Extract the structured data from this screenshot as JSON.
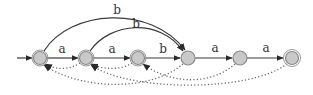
{
  "diagram": {
    "type": "finite-automaton",
    "colors": {
      "node_fill": "#c9c9c9",
      "node_stroke": "#8a8a8a",
      "edge": "#3a3a3a",
      "failure_link": "#6a6a6a"
    },
    "nodes": [
      {
        "id": "q0",
        "x": 40,
        "y": 58,
        "initial": true,
        "accepting": false
      },
      {
        "id": "q1",
        "x": 86,
        "y": 58,
        "initial": false,
        "accepting": false
      },
      {
        "id": "q2",
        "x": 138,
        "y": 58,
        "initial": false,
        "accepting": false
      },
      {
        "id": "q3",
        "x": 188,
        "y": 58,
        "initial": false,
        "accepting": false
      },
      {
        "id": "q4",
        "x": 240,
        "y": 58,
        "initial": false,
        "accepting": false
      },
      {
        "id": "q5",
        "x": 292,
        "y": 58,
        "initial": false,
        "accepting": true
      }
    ],
    "transitions": [
      {
        "from": "q0",
        "to": "q1",
        "label": "a"
      },
      {
        "from": "q1",
        "to": "q2",
        "label": "a"
      },
      {
        "from": "q2",
        "to": "q3",
        "label": "b"
      },
      {
        "from": "q3",
        "to": "q4",
        "label": "a"
      },
      {
        "from": "q4",
        "to": "q5",
        "label": "a"
      },
      {
        "from": "q0",
        "to": "q3",
        "label": "b"
      },
      {
        "from": "q1",
        "to": "q3",
        "label": "b"
      }
    ],
    "failure_links": [
      {
        "from": "q1",
        "to": "q0"
      },
      {
        "from": "q2",
        "to": "q1"
      },
      {
        "from": "q3",
        "to": "q0"
      },
      {
        "from": "q4",
        "to": "q2"
      },
      {
        "from": "q5",
        "to": "q1"
      }
    ]
  }
}
